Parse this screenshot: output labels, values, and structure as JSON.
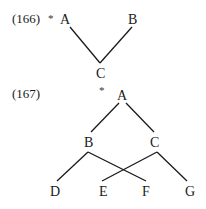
{
  "examples": [
    {
      "number": "(166)",
      "marker": "*",
      "nodes": {
        "A": "A",
        "B": "B",
        "C": "C"
      },
      "edges": [
        [
          "A",
          "C"
        ],
        [
          "B",
          "C"
        ]
      ]
    },
    {
      "number": "(167)",
      "marker": "*",
      "nodes": {
        "A": "A",
        "B": "B",
        "C": "C",
        "D": "D",
        "E": "E",
        "F": "F",
        "G": "G"
      },
      "edges": [
        [
          "A",
          "B"
        ],
        [
          "A",
          "C"
        ],
        [
          "B",
          "D"
        ],
        [
          "B",
          "F"
        ],
        [
          "C",
          "E"
        ],
        [
          "C",
          "G"
        ]
      ]
    }
  ]
}
